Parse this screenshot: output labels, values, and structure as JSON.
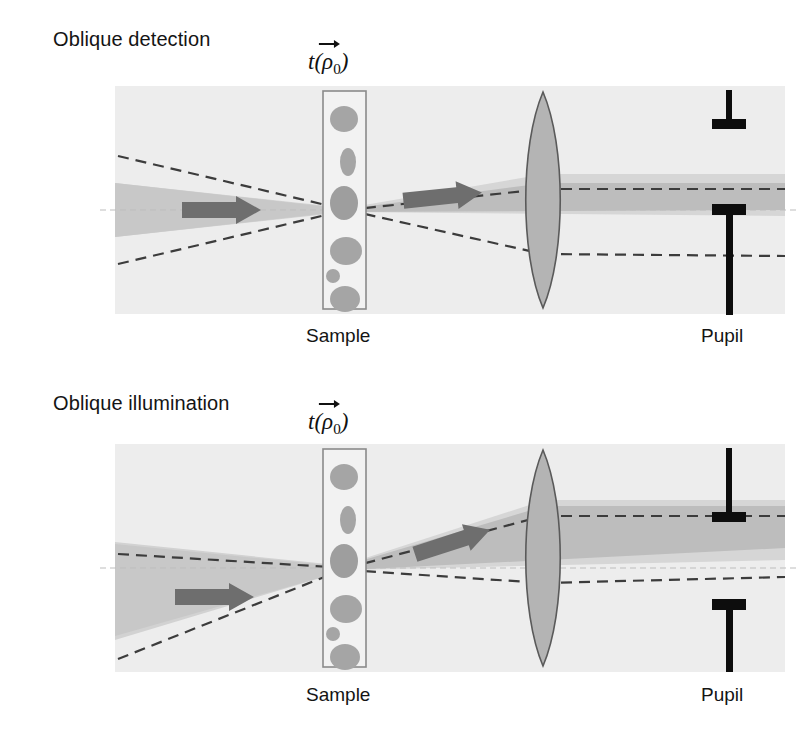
{
  "figure": {
    "background": "#ffffff",
    "panel_bg": "#eeeeee",
    "beam_light": "#dcdcdc",
    "beam_dark": "#bebebe",
    "lens_fill": "#b4b4b4",
    "lens_stroke": "#4a4a4a",
    "particle_fill": "#a8a8a8",
    "sample_stroke": "#8a8a8a",
    "dash_color": "#3c3c3c",
    "axis_color": "#b9b9b9",
    "arrow_fill": "#6e6e6e",
    "stop_color": "#0d0d0d",
    "text_color": "#141414"
  },
  "panels": [
    {
      "id": "oblique-detection",
      "title": "Oblique detection",
      "sample_label": {
        "fn": "t",
        "open": "(",
        "vector": "ρ",
        "sub": "0",
        "close": ")"
      },
      "incident_label": {
        "letter": "F",
        "sub": "i"
      },
      "output_label": {
        "letter": "F",
        "sub": "0"
      },
      "sample_caption": "Sample",
      "pupil_caption": "Pupil",
      "description": "On-axis convergent illumination focused at the sample; scattered light collected obliquely above the axis, pupil stops offset so only the upper half of the pupil transmits."
    },
    {
      "id": "oblique-illumination",
      "title": "Oblique illumination",
      "sample_label": {
        "fn": "t",
        "open": "(",
        "vector": "ρ",
        "sub": "0",
        "close": ")"
      },
      "incident_label": {
        "letter": "F",
        "sub": "i"
      },
      "output_label": {
        "letter": "F",
        "sub": "0"
      },
      "sample_caption": "Sample",
      "pupil_caption": "Pupil",
      "description": "Tilted convergent illumination arriving obliquely at the sample; collected beam exits tilted upward and is collimated high in the pupil, pupil stops offset upward."
    }
  ]
}
